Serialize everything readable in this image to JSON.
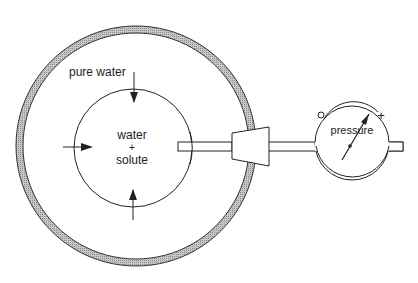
{
  "labels": {
    "outer": "pure water",
    "inner_line1": "water",
    "inner_line2": "+",
    "inner_line3": "solute",
    "gauge": "pressure",
    "gauge_min": "O",
    "gauge_max": "+"
  },
  "colors": {
    "stroke": "#222222",
    "membrane_fill": "#b8b8b8",
    "background": "#ffffff"
  }
}
